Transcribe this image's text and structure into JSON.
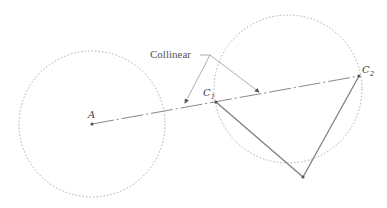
{
  "diagram": {
    "callout_label": "Collinear",
    "points": {
      "A": {
        "label": "A",
        "x": 92,
        "y": 124
      },
      "C1": {
        "label": "C",
        "sub": "1",
        "x": 216,
        "y": 102
      },
      "C2": {
        "label": "C",
        "sub": "2",
        "x": 359,
        "y": 76
      },
      "bottom": {
        "x": 303,
        "y": 177
      }
    },
    "circles": [
      {
        "cx": 92,
        "cy": 124,
        "r": 73
      },
      {
        "cx": 288,
        "cy": 89,
        "r": 74
      }
    ],
    "colors": {
      "circle": "#aaaaaa",
      "line": "#888888",
      "triangle": "#7a7a7a",
      "text": "#444444"
    }
  }
}
